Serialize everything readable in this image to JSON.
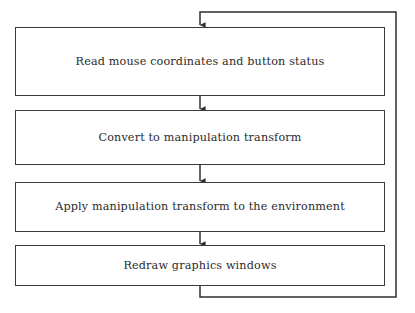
{
  "diagram": {
    "type": "flowchart",
    "orientation": "vertical-sequence-with-feedback-loop",
    "background_color": "#ffffff",
    "line_color": "#3a3a3a",
    "text_color": "#2b2b2b",
    "nodes": [
      {
        "id": "read-input",
        "label": "Read mouse coordinates and button status",
        "shape": "rectangle",
        "x": 15,
        "y": 27,
        "width": 370,
        "height": 69
      },
      {
        "id": "convert-transform",
        "label": "Convert to manipulation transform",
        "shape": "rectangle",
        "x": 15,
        "y": 110,
        "width": 370,
        "height": 55
      },
      {
        "id": "apply-transform",
        "label": "Apply manipulation transform to the environment",
        "shape": "rectangle",
        "x": 15,
        "y": 182,
        "width": 370,
        "height": 50
      },
      {
        "id": "redraw-windows",
        "label": "Redraw graphics windows",
        "shape": "rectangle",
        "x": 15,
        "y": 245,
        "width": 370,
        "height": 41
      }
    ],
    "connectors": [
      {
        "id": "conn-1-2",
        "from": "read-input",
        "to": "convert-transform",
        "kind": "straight-down",
        "arrowhead": "down"
      },
      {
        "id": "conn-2-3",
        "from": "convert-transform",
        "to": "apply-transform",
        "kind": "straight-down",
        "arrowhead": "down"
      },
      {
        "id": "conn-3-4",
        "from": "apply-transform",
        "to": "redraw-windows",
        "kind": "straight-down",
        "arrowhead": "down"
      },
      {
        "id": "conn-feedback",
        "from": "redraw-windows",
        "to": "read-input",
        "kind": "feedback-loop-right",
        "arrowhead": "down"
      }
    ]
  }
}
